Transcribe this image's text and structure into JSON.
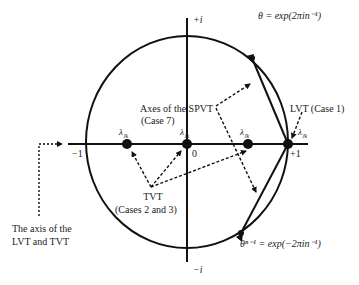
{
  "diagram": {
    "type": "unit-circle",
    "axes": {
      "imag_top": "+i",
      "imag_bottom": "−i",
      "real_left": "−1",
      "real_right": "+1",
      "origin": "0"
    },
    "points": [
      {
        "label": "λ₁ₖ",
        "label_text": "λ",
        "sub": "Jk",
        "position": "left"
      },
      {
        "label": "λ₁ₖ",
        "label_text": "λ",
        "sub": "Jk",
        "position": "origin"
      },
      {
        "label": "λ₁ₖ",
        "label_text": "λ",
        "sub": "Jk",
        "position": "right-inner"
      },
      {
        "label": "λ₁ₖ",
        "label_text": "λ",
        "sub": "Jk",
        "position": "+1"
      }
    ],
    "theta_top": "θ = exp(2πin⁻¹)",
    "theta_bottom": "θⁿ⁻¹ = exp(−2πin⁻¹)",
    "annotations": {
      "spvt_line1": "Axes of the SPVT",
      "spvt_line2": "(Case 7)",
      "lvt": "LVT (Case 1)",
      "tvt_line1": "TVT",
      "tvt_line2": "(Cases 2 and 3)",
      "axis_line1": "The axis of the",
      "axis_line2": "LVT and TVT"
    },
    "colors": {
      "stroke": "#111111",
      "text": "#222222",
      "background": "#ffffff"
    }
  }
}
